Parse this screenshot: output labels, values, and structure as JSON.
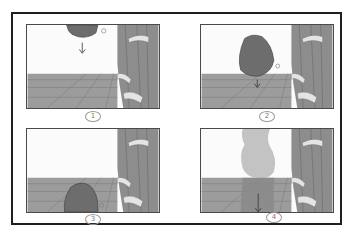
{
  "storyboard": {
    "panels": [
      {
        "id": 1,
        "label": "1",
        "description": "Rock at top of frame, arrow pointing down",
        "rock_position": "top",
        "arrow": "down"
      },
      {
        "id": 2,
        "label": "2",
        "description": "Rock falling mid-air above floor, small arrow below",
        "rock_position": "middle",
        "arrow": "down"
      },
      {
        "id": 3,
        "label": "3",
        "description": "Rock near bottom of frame on floor",
        "rock_position": "bottom",
        "arrow": "none"
      },
      {
        "id": 4,
        "label": "4",
        "description": "Rock faded motion trail, arrow pointing down",
        "rock_position": "ghost",
        "arrow": "down"
      }
    ],
    "colors": {
      "frame_border": "#1f1f1f",
      "panel_border": "#4a4a4a",
      "wall": "#fbfbfb",
      "floor": "#9c9c9c",
      "floor_lines": "#7e7e7e",
      "pillar": "#8d8d8d",
      "pillar_dark": "#6f6f6f",
      "rock": "#6d6d6d",
      "rock_ghost": "#b9b9b9",
      "snow": "#e4e4e4"
    }
  }
}
